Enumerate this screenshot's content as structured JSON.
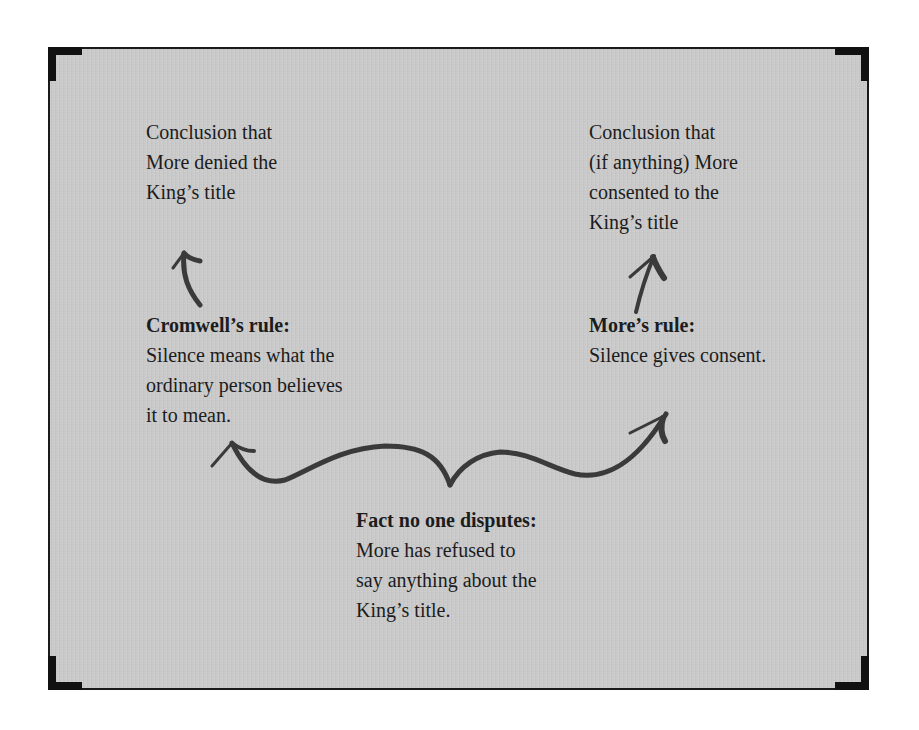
{
  "diagram": {
    "title": "",
    "colors": {
      "panel_background": "#c9c9c9",
      "frame": "#1a1a1a",
      "text": "#1c1c1c",
      "arrow": "#3a3a3a"
    },
    "nodes": {
      "left_conclusion": {
        "lines": [
          "Conclusion that",
          "More denied the",
          "King’s title"
        ]
      },
      "right_conclusion": {
        "lines": [
          "Conclusion that",
          "(if anything) More",
          "consented to the",
          "King’s title"
        ]
      },
      "cromwell_rule": {
        "heading": "Cromwell’s rule:",
        "lines": [
          "Silence means what the",
          "ordinary person believes",
          "it to mean."
        ]
      },
      "more_rule": {
        "heading": "More’s rule:",
        "lines": [
          "Silence gives consent."
        ]
      },
      "fact": {
        "heading": "Fact no one disputes:",
        "lines": [
          "More has refused to",
          "say anything about the",
          "King’s title."
        ]
      }
    },
    "edges": [
      {
        "from": "cromwell_rule",
        "to": "left_conclusion",
        "type": "arrow"
      },
      {
        "from": "more_rule",
        "to": "right_conclusion",
        "type": "arrow"
      },
      {
        "from": "fact",
        "to": "cromwell_rule",
        "type": "brace-arrow"
      },
      {
        "from": "fact",
        "to": "more_rule",
        "type": "brace-arrow"
      }
    ]
  }
}
